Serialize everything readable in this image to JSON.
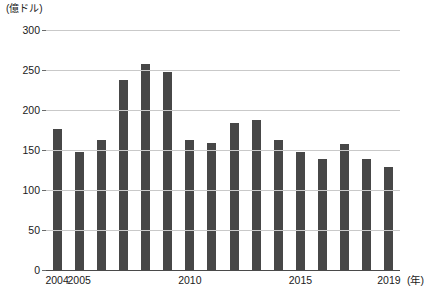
{
  "chart_data": {
    "type": "bar",
    "title": "",
    "unit_label": "(億ドル)",
    "xlabel": "(年)",
    "ylabel": "",
    "ylim": [
      0,
      300
    ],
    "yticks": [
      0,
      50,
      100,
      150,
      200,
      250,
      300
    ],
    "grid": true,
    "legend": "none",
    "categories": [
      "2004",
      "2005",
      "2006",
      "2007",
      "2008",
      "2009",
      "2010",
      "2011",
      "2012",
      "2013",
      "2014",
      "2015",
      "2016",
      "2017",
      "2018",
      "2019"
    ],
    "x_tick_labels": [
      "2004",
      "2005",
      "2010",
      "2015",
      "2019"
    ],
    "values": [
      176,
      148,
      162,
      237,
      258,
      248,
      162,
      159,
      184,
      187,
      162,
      148,
      139,
      157,
      139,
      129
    ],
    "bar_color": "#474747",
    "grid_color": "#c9c9c9",
    "axis_color": "#4a4a4a"
  }
}
